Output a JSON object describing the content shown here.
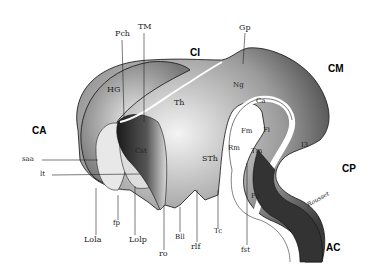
{
  "figure": {
    "type": "anatomical brain section drawing",
    "colors": {
      "ink": "#111111",
      "background": "#ffffff",
      "shade": "#555555"
    },
    "labels": {
      "CA": "CA",
      "CI": "CI",
      "CM": "CM",
      "CP": "CP",
      "AC": "AC",
      "HG": "HG",
      "Pch": "Pch",
      "TM": "TM",
      "Gp": "Gp",
      "Ng": "Ng",
      "Th": "Th",
      "Ca": "Ca",
      "Fm": "Fm",
      "Fi": "Fi",
      "Rm": "Rm",
      "Tm": "Tm",
      "STh": "STh",
      "Cst": "Cst",
      "I3": "I3",
      "Pe": "Pe",
      "saa": "saa",
      "lt": "lt",
      "Lola": "Lola",
      "fp": "fp",
      "Lolp": "Lolp",
      "ro": "ro",
      "Bll": "Bll",
      "rlf": "rlf",
      "Tc": "Tc",
      "fst": "fst",
      "signature": "Rousset"
    }
  }
}
